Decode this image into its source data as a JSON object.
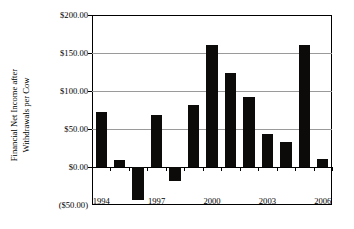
{
  "chart_data": {
    "type": "bar",
    "title": "",
    "subtitle": "",
    "xlabel": "",
    "ylabel": "Financial Net Income after Withdrawals per Cow",
    "ylabel_line1": "Financial Net Income after",
    "ylabel_line2": "Withdrawals per Cow",
    "categories": [
      1994,
      1995,
      1996,
      1997,
      1998,
      1999,
      2000,
      2001,
      2002,
      2003,
      2004,
      2005,
      2006
    ],
    "values": [
      73,
      9,
      -43,
      68,
      -18,
      82,
      160,
      124,
      92,
      44,
      33,
      161,
      11
    ],
    "x_tick_labels": [
      "1994",
      "1997",
      "2000",
      "2003",
      "2006"
    ],
    "x_tick_categories": [
      1994,
      1997,
      2000,
      2003,
      2006
    ],
    "y_tick_labels": [
      "$200.00",
      "$150.00",
      "$100.00",
      "$50.00",
      "$0.00",
      "($50.00)"
    ],
    "y_tick_values": [
      200,
      150,
      100,
      50,
      0,
      -50
    ],
    "ylim": [
      -50,
      200
    ],
    "grid": true,
    "gridlines_at": [
      150,
      100,
      50
    ],
    "legend": null,
    "legend_position": "none",
    "bar_color": "#0d0a0a",
    "grid_color": "#9a9a9a",
    "axis_color": "#000000",
    "background_color": "#ffffff"
  }
}
